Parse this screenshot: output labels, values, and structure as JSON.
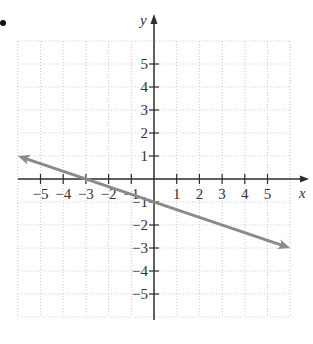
{
  "chart_data": {
    "type": "line",
    "title": "",
    "xlabel": "x",
    "ylabel": "y",
    "xlim": [
      -6,
      6
    ],
    "ylim": [
      -6,
      6
    ],
    "grid": true,
    "grid_style": "dotted",
    "x_ticks": [
      -5,
      -4,
      -3,
      -2,
      -1,
      1,
      2,
      3,
      4,
      5
    ],
    "y_ticks": [
      -5,
      -4,
      -3,
      -2,
      -1,
      1,
      2,
      3,
      4,
      5
    ],
    "x_tick_labels": [
      "−5",
      "−4",
      "−3",
      "−2",
      "−1",
      "1",
      "2",
      "3",
      "4",
      "5"
    ],
    "y_tick_labels": [
      "−5",
      "−4",
      "−3",
      "−2",
      "−1",
      "1",
      "2",
      "3",
      "4",
      "5"
    ],
    "series": [
      {
        "name": "line",
        "equation": "y = -x/3 - 1",
        "slope": -0.3333,
        "y_intercept": -1,
        "x_intercept": -3,
        "x": [
          -6,
          -3,
          0,
          3,
          6
        ],
        "y": [
          1,
          0,
          -1,
          -2,
          -3
        ],
        "arrows": "both",
        "color": "#8a8a8a"
      }
    ],
    "axis_color": "#2e2e2e",
    "grid_color": "#c8c8c8"
  },
  "labels": {
    "x_axis": "x",
    "y_axis": "y",
    "bullet": "•"
  }
}
